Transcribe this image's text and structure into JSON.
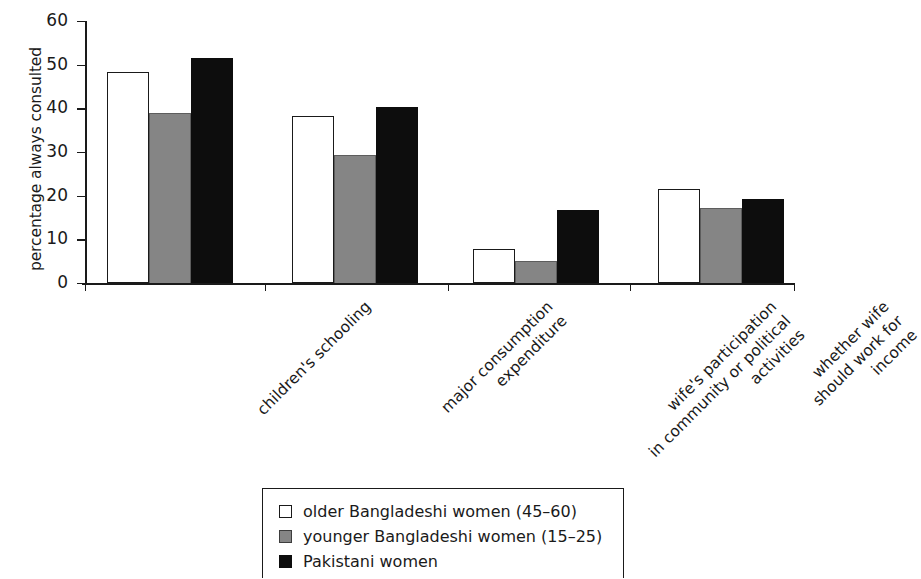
{
  "chart_data": {
    "type": "bar",
    "title": "",
    "xlabel": "",
    "ylabel": "percentage always consulted",
    "ylim": [
      0,
      60
    ],
    "yticks": [
      0,
      10,
      20,
      30,
      40,
      50,
      60
    ],
    "grid": false,
    "legend_position": "bottom",
    "categories": [
      [
        "children's schooling"
      ],
      [
        "major consumption",
        "expenditure"
      ],
      [
        "wife's participation",
        "in community or political",
        "activities"
      ],
      [
        "whether wife",
        "should work for",
        "income"
      ]
    ],
    "category_labels_flat": [
      "children's schooling",
      "major consumption expenditure",
      "wife's participation in community or political activities",
      "whether wife should work for income"
    ],
    "series": [
      {
        "name": "older Bangladeshi women (45–60)",
        "swatch": "white",
        "color": "#ffffff",
        "values": [
          48.3,
          38.2,
          7.8,
          21.6
        ]
      },
      {
        "name": "younger Bangladeshi women (15–25)",
        "swatch": "gray",
        "color": "#858585",
        "values": [
          38.9,
          29.3,
          5.0,
          17.3
        ]
      },
      {
        "name": "Pakistani women",
        "swatch": "black",
        "color": "#0d0d0d",
        "values": [
          51.5,
          40.3,
          16.7,
          19.3
        ]
      }
    ]
  },
  "axis": {
    "y_title": "percentage always consulted",
    "y_tick_labels": [
      "0",
      "10",
      "20",
      "30",
      "40",
      "50",
      "60"
    ]
  },
  "legend": {
    "entries": [
      {
        "label": "older Bangladeshi women (45–60)",
        "swatch": "white"
      },
      {
        "label": "younger Bangladeshi women (15–25)",
        "swatch": "gray"
      },
      {
        "label": "Pakistani women",
        "swatch": "black"
      }
    ]
  }
}
